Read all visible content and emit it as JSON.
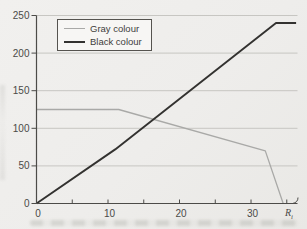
{
  "chart_data": {
    "type": "line",
    "title": "",
    "xlabel_base": "R",
    "xlabel_sub": "i",
    "ylabel": "",
    "xlim": [
      0,
      36.5
    ],
    "ylim": [
      0,
      250
    ],
    "x_ticks_labeled": [
      0,
      10,
      20,
      30
    ],
    "x_ticks_minor": [
      5,
      15,
      25,
      35
    ],
    "y_ticks": [
      0,
      50,
      100,
      150,
      200,
      250
    ],
    "grid": "horizontal",
    "legend_position": "top-left",
    "series": [
      {
        "name": "Gray colour",
        "color": "#a9a9a7",
        "width": 1.3,
        "points": [
          [
            0,
            125
          ],
          [
            11.5,
            125
          ],
          [
            32,
            70
          ],
          [
            34.5,
            0
          ]
        ]
      },
      {
        "name": "Black colour",
        "color": "#333230",
        "width": 1.9,
        "points": [
          [
            0,
            0
          ],
          [
            11,
            72
          ],
          [
            33.5,
            240
          ],
          [
            36.3,
            240
          ]
        ]
      }
    ],
    "colors": {
      "axis": "#4c4b48",
      "grid": "#c7c6c2",
      "tick_text": "#4a4a48",
      "background": "#efeeec"
    }
  }
}
